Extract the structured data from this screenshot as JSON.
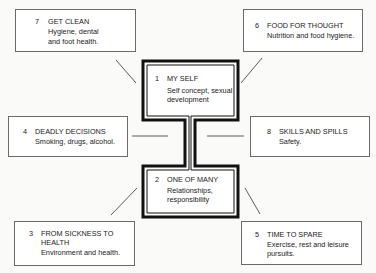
{
  "diagram": {
    "central": [
      {
        "num": "1",
        "title": "MY SELF",
        "desc_lines": [
          "Self concept, sexual",
          "development"
        ]
      },
      {
        "num": "2",
        "title": "ONE OF MANY",
        "desc_lines": [
          "Relationships,",
          "responsibility"
        ]
      }
    ],
    "topics": [
      {
        "id": "7",
        "num": "7",
        "title": "GET CLEAN",
        "desc_lines": [
          "Hygiene, dental",
          "and foot health."
        ]
      },
      {
        "id": "6",
        "num": "6",
        "title": "FOOD FOR THOUGHT",
        "desc_lines": [
          "Nutrition and food hygiene."
        ]
      },
      {
        "id": "4",
        "num": "4",
        "title": "DEADLY DECISIONS",
        "desc_lines": [
          "Smoking, drugs, alcohol."
        ]
      },
      {
        "id": "8",
        "num": "8",
        "title": "SKILLS AND SPILLS",
        "desc_lines": [
          "Safety."
        ]
      },
      {
        "id": "3",
        "num": "3",
        "title_lines": [
          "FROM SICKNESS TO",
          "HEALTH"
        ],
        "desc_lines": [
          "Environment and health."
        ]
      },
      {
        "id": "5",
        "num": "5",
        "title": "TIME TO SPARE",
        "desc_lines": [
          "Exercise, rest and leisure",
          "pursuits."
        ]
      }
    ],
    "colors": {
      "frame": "#111111",
      "box_border": "#6a6a6a",
      "text": "#222222",
      "background": "#fafaf8"
    }
  }
}
